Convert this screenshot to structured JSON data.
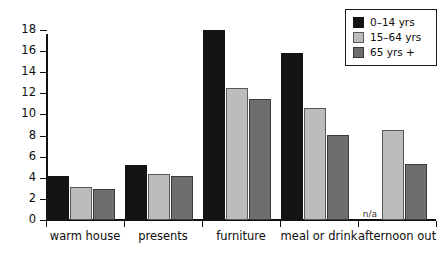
{
  "chart_data": {
    "type": "bar",
    "title": "",
    "subtitle": "",
    "xlabel": "",
    "ylabel": "",
    "ylim": [
      0,
      18
    ],
    "ytick_step": 2,
    "yticks": [
      0,
      2,
      4,
      6,
      8,
      10,
      12,
      14,
      16,
      18
    ],
    "grid": false,
    "legend_position": "top-right",
    "categories": [
      "warm house",
      "presents",
      "furniture",
      "meal or drink",
      "afternoon out"
    ],
    "series": [
      {
        "name": "0–14 yrs",
        "color": "#141414",
        "values": [
          4.2,
          5.2,
          18.0,
          15.8,
          null
        ],
        "value_labels": [
          "",
          "",
          "",
          "",
          "n/a"
        ]
      },
      {
        "name": "15–64 yrs",
        "color": "#bcbcbc",
        "values": [
          3.1,
          4.4,
          12.5,
          10.6,
          8.5
        ],
        "value_labels": [
          "",
          "",
          "",
          "",
          ""
        ]
      },
      {
        "name": "65 yrs +",
        "color": "#6e6e6e",
        "values": [
          2.9,
          4.2,
          11.5,
          8.1,
          5.3
        ],
        "value_labels": [
          "",
          "",
          "",
          "",
          ""
        ]
      }
    ],
    "annotations": [
      {
        "text": "n/a",
        "category": "afternoon out",
        "series": "0–14 yrs"
      }
    ]
  },
  "legend": {
    "entries": [
      {
        "label": "0–14 yrs"
      },
      {
        "label": "15–64 yrs"
      },
      {
        "label": "65 yrs +"
      }
    ]
  },
  "colors": {
    "series_0": "#141414",
    "series_1": "#bcbcbc",
    "series_2": "#6e6e6e",
    "axis": "#101010",
    "background": "#ffffff"
  }
}
